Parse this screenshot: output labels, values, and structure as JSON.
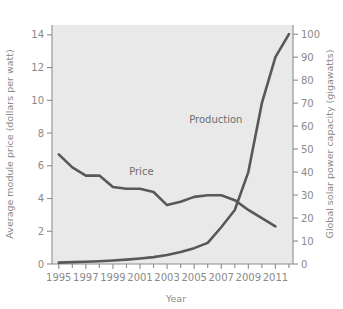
{
  "chart_data": {
    "type": "line",
    "title": "",
    "xlabel": "Year",
    "ylabel": "Average module price (dollars per watt)",
    "y2label": "Global solar power capacity (gigawatts)",
    "grid": false,
    "legend": "inline-annotations",
    "xlim": [
      1994.5,
      2012.3
    ],
    "ylim": [
      0,
      14.6
    ],
    "y2lim": [
      0,
      104
    ],
    "x_ticks_major": [
      1995,
      1997,
      1999,
      2001,
      2003,
      2005,
      2007,
      2009,
      2011
    ],
    "x_tick_labels": [
      "1995",
      "1997",
      "1999",
      "2001",
      "2003",
      "2005",
      "2007",
      "2009",
      "2011"
    ],
    "x_ticks_minor": [
      1996,
      1998,
      2000,
      2002,
      2004,
      2006,
      2008,
      2010,
      2012
    ],
    "y_ticks": [
      0,
      2,
      4,
      6,
      8,
      10,
      12,
      14
    ],
    "y_tick_labels": [
      "0",
      "2",
      "4",
      "6",
      "8",
      "10",
      "12",
      "14"
    ],
    "y2_ticks": [
      0,
      10,
      20,
      30,
      40,
      50,
      60,
      70,
      80,
      90,
      100
    ],
    "y2_tick_labels": [
      "0",
      "10",
      "20",
      "30",
      "40",
      "50",
      "60",
      "70",
      "80",
      "90",
      "100"
    ],
    "series": [
      {
        "name": "Price",
        "axis": "left",
        "units": "dollars per watt",
        "label_text": "Price",
        "label_x": 2001.1,
        "label_y": 5.45,
        "x": [
          1995,
          1996,
          1997,
          1998,
          1999,
          2000,
          2001,
          2002,
          2003,
          2004,
          2005,
          2006,
          2007,
          2008,
          2009,
          2010,
          2011
        ],
        "values": [
          6.7,
          5.9,
          5.4,
          5.4,
          4.7,
          4.6,
          4.6,
          4.4,
          3.6,
          3.8,
          4.1,
          4.2,
          4.2,
          3.9,
          3.3,
          2.8,
          2.3
        ]
      },
      {
        "name": "Production",
        "axis": "right",
        "units": "gigawatts",
        "label_text": "Production",
        "label_x": 2006.6,
        "label_y": 61.5,
        "x": [
          1995,
          1996,
          1997,
          1998,
          1999,
          2000,
          2001,
          2002,
          2003,
          2004,
          2005,
          2006,
          2007,
          2008,
          2009,
          2010,
          2011,
          2012
        ],
        "values": [
          0.6,
          0.8,
          1.0,
          1.2,
          1.5,
          1.9,
          2.4,
          3.0,
          3.9,
          5.2,
          6.9,
          9.2,
          16.0,
          23.5,
          40.0,
          70.0,
          90.0,
          100.0
        ]
      }
    ],
    "colors": {
      "line": "#585858",
      "plot_background": "#e9e9e9",
      "axis": "#8d8d8d",
      "text": "#8a8a8a",
      "page_background": "#ffffff"
    }
  }
}
